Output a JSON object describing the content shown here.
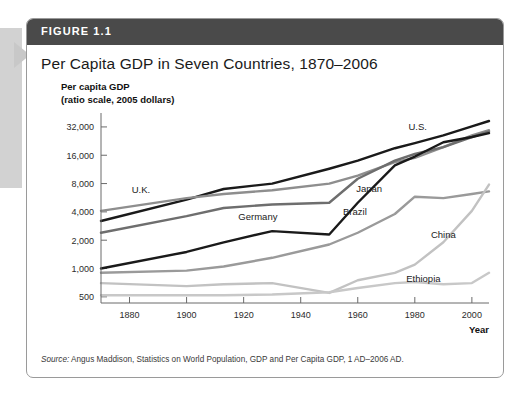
{
  "figure": {
    "label": "FIGURE 1.1",
    "title": "Per Capita GDP in Seven Countries, 1870–2006",
    "axis_caption_line1": "Per capita GDP",
    "axis_caption_line2": "(ratio scale, 2005 dollars)",
    "source_lead": "Source:",
    "source_text": " Angus Maddison, Statistics on World Population, GDP and Per Capita GDP, 1 AD–2006 AD.",
    "header_bg": "#4a4a4a",
    "header_text_color": "#ffffff",
    "card_bg": "#ffffff",
    "card_border": "#9a9a9a"
  },
  "chart_data": {
    "type": "line",
    "title": "Per Capita GDP in Seven Countries, 1870–2006",
    "xlabel": "Year",
    "ylabel": "Per capita GDP (ratio scale, 2005 dollars)",
    "yscale": "log",
    "ylim": [
      430,
      45000
    ],
    "xlim": [
      1870,
      2006
    ],
    "grid": false,
    "legend_position": "inline-labels",
    "ytick_values": [
      500,
      1000,
      2000,
      4000,
      8000,
      16000,
      32000
    ],
    "ytick_labels": [
      "500",
      "1,000",
      "2,000",
      "4,000",
      "8,000",
      "16,000",
      "32,000"
    ],
    "xtick_values": [
      1880,
      1900,
      1920,
      1940,
      1960,
      1980,
      2000
    ],
    "xtick_labels": [
      "1880",
      "1900",
      "1920",
      "1940",
      "1960",
      "1980",
      "2000"
    ],
    "series": [
      {
        "name": "U.S.",
        "color": "#1a1a1a",
        "width": 2.4,
        "label_x": 1981,
        "label_y": 30000,
        "x": [
          1870,
          1900,
          1913,
          1930,
          1950,
          1960,
          1973,
          1980,
          1990,
          2000,
          2006
        ],
        "values": [
          3200,
          5400,
          7000,
          8000,
          11500,
          14000,
          19000,
          21500,
          26000,
          32500,
          37000
        ]
      },
      {
        "name": "U.K.",
        "color": "#8e8e8e",
        "width": 2.4,
        "label_x": 1884,
        "label_y": 6400,
        "x": [
          1870,
          1900,
          1913,
          1930,
          1950,
          1960,
          1973,
          1980,
          1990,
          2000,
          2006
        ],
        "values": [
          4100,
          5600,
          6200,
          6800,
          8000,
          9700,
          13500,
          15000,
          19500,
          26000,
          29500
        ]
      },
      {
        "name": "Germany",
        "color": "#6e6e6e",
        "width": 2.4,
        "label_x": 1925,
        "label_y": 3300,
        "x": [
          1870,
          1900,
          1913,
          1930,
          1950,
          1960,
          1973,
          1980,
          1990,
          2000,
          2006
        ],
        "values": [
          2400,
          3600,
          4400,
          4800,
          5000,
          9000,
          14000,
          16500,
          19500,
          25000,
          28500
        ]
      },
      {
        "name": "Japan",
        "color": "#1a1a1a",
        "width": 2.4,
        "label_x": 1964,
        "label_y": 6500,
        "x": [
          1870,
          1900,
          1913,
          1930,
          1950,
          1960,
          1973,
          1980,
          1990,
          2000,
          2006
        ],
        "values": [
          1000,
          1500,
          1900,
          2500,
          2300,
          5000,
          12500,
          15500,
          22000,
          25000,
          27500
        ]
      },
      {
        "name": "Brazil",
        "color": "#9a9a9a",
        "width": 2.4,
        "label_x": 1959,
        "label_y": 3700,
        "x": [
          1870,
          1900,
          1913,
          1930,
          1950,
          1960,
          1973,
          1980,
          1990,
          2000,
          2006
        ],
        "values": [
          900,
          950,
          1050,
          1300,
          1800,
          2400,
          3800,
          5800,
          5600,
          6200,
          6600
        ]
      },
      {
        "name": "China",
        "color": "#c2c2c2",
        "width": 2.4,
        "label_x": 1990,
        "label_y": 2100,
        "x": [
          1870,
          1900,
          1913,
          1930,
          1950,
          1960,
          1973,
          1980,
          1990,
          2000,
          2006
        ],
        "values": [
          700,
          650,
          680,
          700,
          550,
          750,
          900,
          1100,
          1900,
          4100,
          7800
        ]
      },
      {
        "name": "Ethiopia",
        "color": "#c8c8c8",
        "width": 2.4,
        "label_x": 1983,
        "label_y": 720,
        "x": [
          1870,
          1900,
          1913,
          1930,
          1950,
          1960,
          1973,
          1980,
          1990,
          2000,
          2006
        ],
        "values": [
          520,
          520,
          520,
          530,
          560,
          620,
          700,
          720,
          680,
          700,
          900
        ]
      }
    ]
  }
}
